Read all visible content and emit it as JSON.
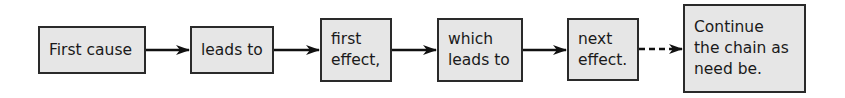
{
  "diagram": {
    "type": "flowchart-chain",
    "nodes": [
      {
        "id": "n1",
        "lines": [
          "First cause"
        ]
      },
      {
        "id": "n2",
        "lines": [
          "leads to"
        ]
      },
      {
        "id": "n3",
        "lines": [
          "first",
          "effect,"
        ]
      },
      {
        "id": "n4",
        "lines": [
          "which",
          "leads to"
        ]
      },
      {
        "id": "n5",
        "lines": [
          "next",
          "effect."
        ]
      },
      {
        "id": "n6",
        "lines": [
          "Continue",
          "the chain as",
          "need be."
        ]
      }
    ],
    "edges": [
      {
        "from": "n1",
        "to": "n2",
        "style": "solid"
      },
      {
        "from": "n2",
        "to": "n3",
        "style": "solid"
      },
      {
        "from": "n3",
        "to": "n4",
        "style": "solid"
      },
      {
        "from": "n4",
        "to": "n5",
        "style": "solid"
      },
      {
        "from": "n5",
        "to": "n6",
        "style": "dashed"
      }
    ],
    "colors": {
      "box_fill": "#e6e6e6",
      "box_border": "#2a2a2a",
      "arrow": "#111111",
      "text": "#1a1a1a"
    }
  }
}
